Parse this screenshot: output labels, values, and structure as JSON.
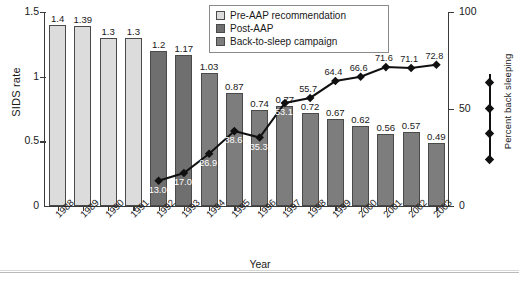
{
  "chart_data": {
    "type": "bar",
    "title": "",
    "xlabel": "Year",
    "ylabel": "SIDS rate",
    "y2label": "Percent back sleeping",
    "categories": [
      "1988",
      "1989",
      "1990",
      "1991",
      "1992",
      "1993",
      "1994",
      "1995",
      "1996",
      "1997",
      "1998",
      "1999",
      "2000",
      "2001",
      "2002",
      "2003"
    ],
    "ylim": [
      0,
      1.5
    ],
    "y2lim": [
      0,
      100
    ],
    "yticks": [
      "0",
      "0.5",
      "1",
      "1.5"
    ],
    "ytick_values": [
      0,
      0.5,
      1,
      1.5
    ],
    "y2ticks": [
      "0",
      "50",
      "100"
    ],
    "y2tick_values": [
      0,
      50,
      100
    ],
    "grid": false,
    "legend_position": "top-right",
    "series": [
      {
        "name": "SIDS rate",
        "type": "bar",
        "axis": "left",
        "values": [
          1.4,
          1.39,
          1.3,
          1.3,
          1.2,
          1.17,
          1.03,
          0.87,
          0.74,
          0.77,
          0.72,
          0.67,
          0.62,
          0.56,
          0.57,
          0.49
        ],
        "labels": [
          "1.4",
          "1.39",
          "1.3",
          "1.3",
          "1.2",
          "1.17",
          "1.03",
          "0.87",
          "0.74",
          "0.77",
          "0.72",
          "0.67",
          "0.62",
          "0.56",
          "0.57",
          "0.49"
        ],
        "groups": [
          "pre",
          "pre",
          "pre",
          "pre",
          "post",
          "post",
          "bts",
          "bts",
          "bts",
          "bts",
          "bts",
          "bts",
          "bts",
          "bts",
          "bts",
          "bts"
        ]
      },
      {
        "name": "Percent back sleeping",
        "type": "line",
        "axis": "right",
        "x": [
          "1992",
          "1993",
          "1994",
          "1995",
          "1996",
          "1997",
          "1998",
          "1999",
          "2000",
          "2001",
          "2002",
          "2003"
        ],
        "values": [
          13.0,
          17.0,
          26.9,
          38.6,
          35.3,
          53.1,
          55.7,
          64.4,
          66.6,
          71.6,
          71.1,
          72.8
        ],
        "labels": [
          "13.0",
          "17.0",
          "26.9",
          "38.6",
          "35.3",
          "53.1",
          "55.7",
          "64.4",
          "66.6",
          "71.6",
          "71.1",
          "72.8"
        ]
      }
    ]
  },
  "legend": {
    "items": [
      {
        "label": "Pre-AAP recommendation",
        "color": "#dcdcdc",
        "key": "pre"
      },
      {
        "label": "Post-AAP",
        "color": "#6f6f6f",
        "key": "post"
      },
      {
        "label": "Back-to-sleep campaign",
        "color": "#7d7d7d",
        "key": "bts"
      }
    ]
  },
  "colors": {
    "pre": "#dcdcdc",
    "post": "#6f6f6f",
    "bts": "#7d7d7d",
    "line": "#101010",
    "axis": "#3a3a3a",
    "text": "#1a1a1a",
    "background": "#ffffff"
  },
  "marker_key": {
    "name": "percent-back-sleeping-marker-key",
    "marker_count": 4
  }
}
